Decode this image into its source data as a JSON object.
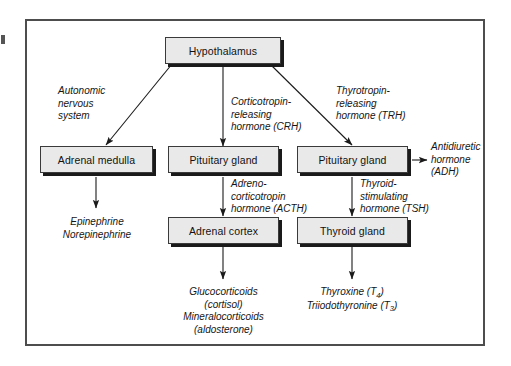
{
  "diagram": {
    "frame_color": "#4d4d4d",
    "box_fill": "#e9e9e9",
    "box_border": "#3a3a3a",
    "shadow_color": "#1a1a1a"
  },
  "nodes": {
    "hypothalamus": "Hypothalamus",
    "adrenal_medulla": "Adrenal medulla",
    "pituitary_gland_anterior": "Pituitary gland",
    "pituitary_gland_posterior": "Pituitary gland",
    "adrenal_cortex": "Adrenal cortex",
    "thyroid_gland": "Thyroid gland"
  },
  "edge_labels": {
    "autonomic": [
      "Autonomic",
      "nervous",
      "system"
    ],
    "crh": [
      "Corticotropin-",
      "releasing",
      "hormone (CRH)"
    ],
    "trh": [
      "Thyrotropin-",
      "releasing",
      "hormone (TRH)"
    ],
    "acth": [
      "Adreno-",
      "corticotropin",
      "hormone (ACTH)"
    ],
    "tsh": [
      "Thyroid-",
      "stimulating",
      "hormone (TSH)"
    ],
    "adh": [
      "Antidiuretic",
      "hormone",
      "(ADH)"
    ]
  },
  "outputs": {
    "medulla_products": [
      "Epinephrine",
      "Norepinephrine"
    ],
    "cortex_products": [
      "Glucocorticoids",
      "(cortisol)",
      "Mineralocorticoids",
      "(aldosterone)"
    ],
    "thyroid_products": [
      {
        "name": "Thyroxine (T",
        "sub": "4",
        "tail": ")"
      },
      {
        "name": "Triiodothyronine (T",
        "sub": "3",
        "tail": ")"
      }
    ]
  }
}
